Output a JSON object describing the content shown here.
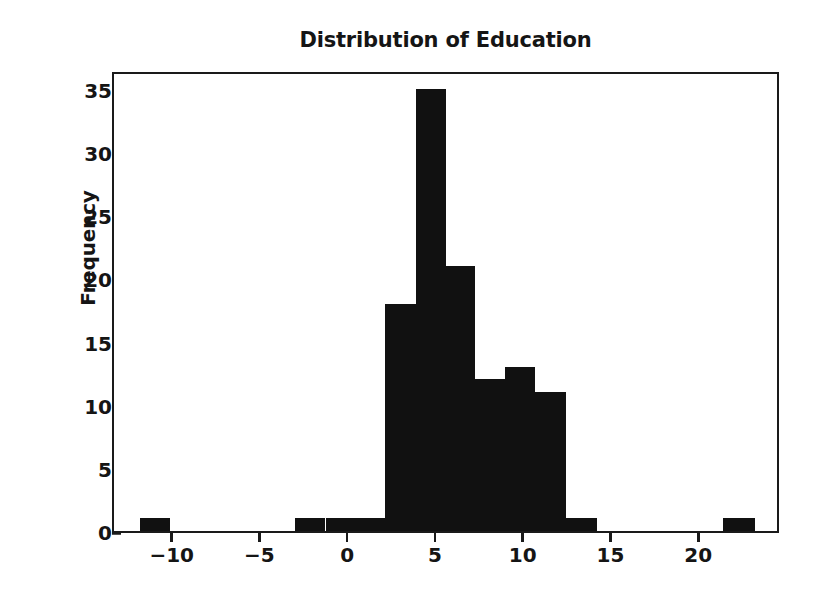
{
  "chart_data": {
    "type": "bar",
    "title": "Distribution of Education",
    "xlabel": "",
    "ylabel": "Frequency",
    "grid": false,
    "legend": false,
    "xlim": [
      -13.4,
      24.6
    ],
    "ylim": [
      0,
      36.5
    ],
    "xticks": [
      -10,
      -5,
      0,
      5,
      10,
      15,
      20
    ],
    "xtick_labels": [
      "−10",
      "−5",
      "0",
      "5",
      "10",
      "15",
      "20"
    ],
    "yticks": [
      0,
      5,
      10,
      15,
      20,
      25,
      30,
      35
    ],
    "ytick_labels": [
      "0",
      "5",
      "10",
      "15",
      "20",
      "25",
      "30",
      "35"
    ],
    "bin_width": 1.75,
    "bars": [
      {
        "left": -11.9,
        "right": -10.2,
        "value": 1
      },
      {
        "left": -3.1,
        "right": -1.35,
        "value": 1
      },
      {
        "left": -1.35,
        "right": 0.4,
        "value": 1
      },
      {
        "left": 0.4,
        "right": 2.05,
        "value": 1
      },
      {
        "left": 2.05,
        "right": 3.8,
        "value": 18
      },
      {
        "left": 3.8,
        "right": 5.5,
        "value": 35
      },
      {
        "left": 5.5,
        "right": 7.15,
        "value": 21
      },
      {
        "left": 7.15,
        "right": 8.9,
        "value": 12
      },
      {
        "left": 8.9,
        "right": 10.6,
        "value": 13
      },
      {
        "left": 10.6,
        "right": 12.35,
        "value": 11
      },
      {
        "left": 12.35,
        "right": 14.1,
        "value": 1
      },
      {
        "left": 21.3,
        "right": 23.1,
        "value": 1
      }
    ],
    "bar_color": "#111111",
    "axis_color": "#1a1a1a",
    "background_color": "#ffffff"
  }
}
